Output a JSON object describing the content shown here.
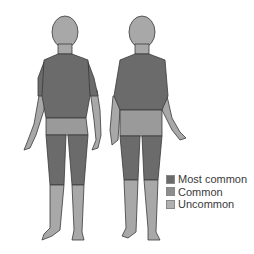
{
  "figure": {
    "views": [
      "front",
      "back"
    ],
    "colors": {
      "most_common": "#6b6b6b",
      "common": "#8d8d8d",
      "uncommon": "#b0b0b0",
      "outline": "#3a3a3a"
    }
  },
  "legend": {
    "items": [
      {
        "label": "Most common",
        "color": "#6b6b6b"
      },
      {
        "label": "Common",
        "color": "#8d8d8d"
      },
      {
        "label": "Uncommon",
        "color": "#b0b0b0"
      }
    ]
  }
}
